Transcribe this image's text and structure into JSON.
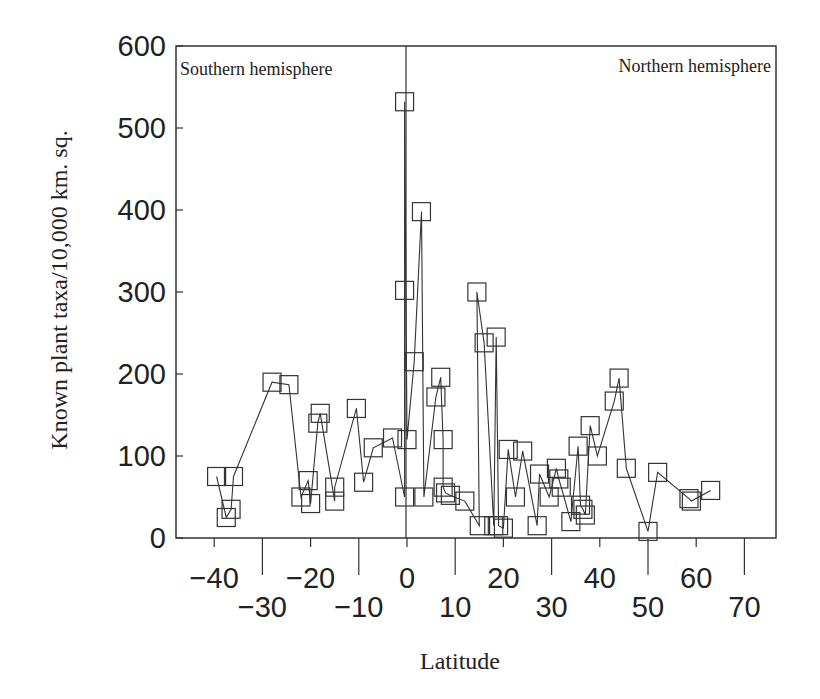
{
  "chart_data": {
    "type": "line",
    "title": "",
    "xlabel": "Latitude",
    "ylabel": "Known plant taxa/10,000 km. sq.",
    "xlim": [
      -45,
      75
    ],
    "ylim": [
      0,
      600
    ],
    "grid": false,
    "legend": null,
    "marker": "open-square",
    "annotations": [
      "Southern hemisphere",
      "Northern hemisphere"
    ],
    "hemisphere_divider_x": 0,
    "x_ticks_upper": [
      -40,
      -20,
      0,
      20,
      40,
      60
    ],
    "x_ticks_lower": [
      -30,
      -10,
      10,
      30,
      50,
      70
    ],
    "y_ticks": [
      0,
      100,
      200,
      300,
      400,
      500,
      600
    ],
    "series": [
      {
        "name": "Known plant taxa",
        "points": [
          [
            -39.5,
            75
          ],
          [
            -37.5,
            25
          ],
          [
            -36.5,
            35
          ],
          [
            -36,
            75
          ],
          [
            -28,
            190
          ],
          [
            -24.5,
            187
          ],
          [
            -22,
            50
          ],
          [
            -20.5,
            70
          ],
          [
            -20,
            42
          ],
          [
            -18.5,
            140
          ],
          [
            -18,
            152
          ],
          [
            -15,
            45
          ],
          [
            -15,
            62
          ],
          [
            -10.5,
            158
          ],
          [
            -9,
            68
          ],
          [
            -7,
            110
          ],
          [
            -3,
            122
          ],
          [
            -0.5,
            50
          ],
          [
            -0.5,
            302
          ],
          [
            -0.5,
            532
          ],
          [
            0,
            120
          ],
          [
            1.5,
            215
          ],
          [
            3,
            398
          ],
          [
            3.5,
            50
          ],
          [
            6,
            172
          ],
          [
            7,
            196
          ],
          [
            7.5,
            120
          ],
          [
            7.5,
            62
          ],
          [
            8,
            55
          ],
          [
            9,
            52
          ],
          [
            12,
            45
          ],
          [
            15,
            15
          ],
          [
            14.5,
            300
          ],
          [
            16,
            238
          ],
          [
            18,
            15
          ],
          [
            18.5,
            245
          ],
          [
            19,
            15
          ],
          [
            20,
            12
          ],
          [
            21,
            108
          ],
          [
            22.5,
            50
          ],
          [
            24,
            106
          ],
          [
            27,
            15
          ],
          [
            27.5,
            78
          ],
          [
            29.5,
            50
          ],
          [
            31,
            85
          ],
          [
            31.5,
            72
          ],
          [
            32,
            62
          ],
          [
            34,
            20
          ],
          [
            35.5,
            112
          ],
          [
            36,
            40
          ],
          [
            36.5,
            35
          ],
          [
            37,
            28
          ],
          [
            38,
            137
          ],
          [
            39.5,
            100
          ],
          [
            43,
            167
          ],
          [
            44,
            195
          ],
          [
            45.5,
            85
          ],
          [
            50,
            8
          ],
          [
            52,
            80
          ],
          [
            58.5,
            48
          ],
          [
            59,
            45
          ],
          [
            63,
            58
          ]
        ]
      }
    ]
  }
}
